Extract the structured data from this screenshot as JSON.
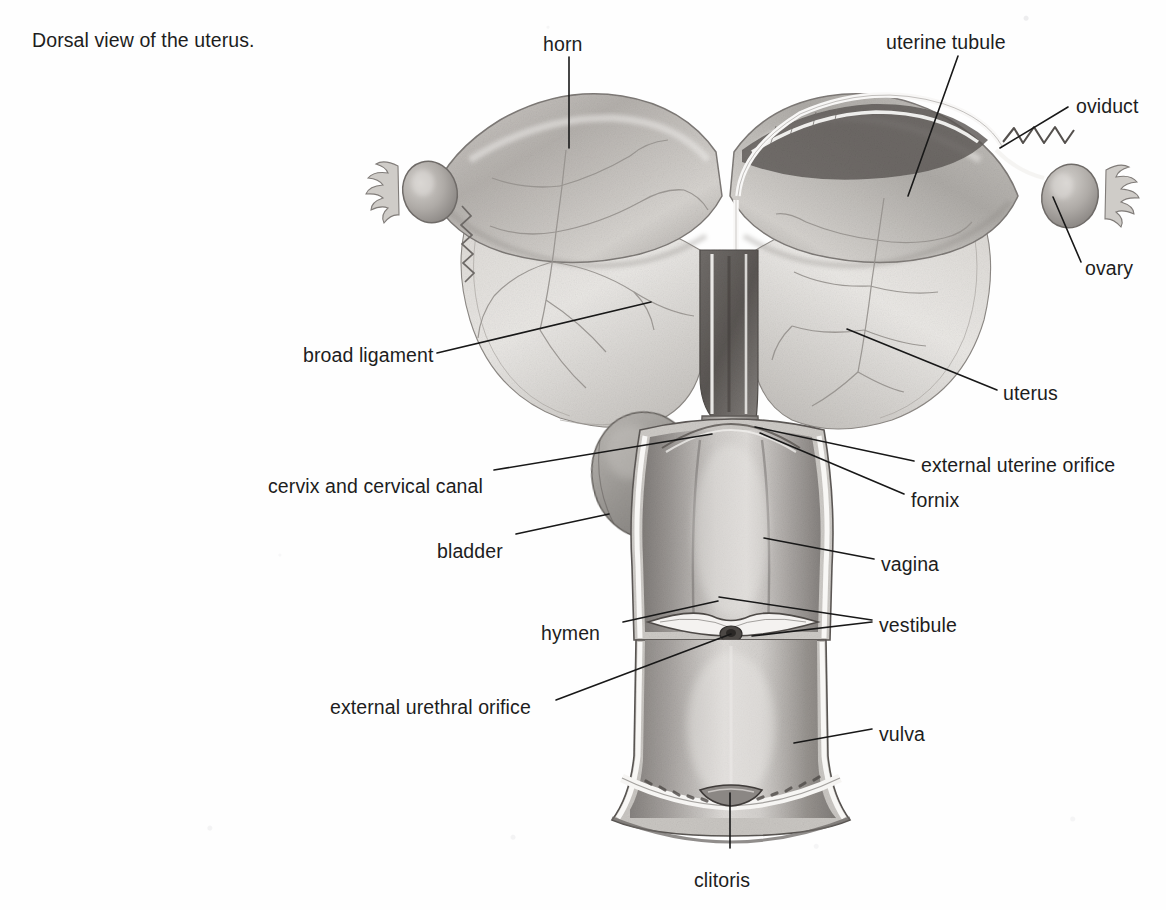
{
  "caption": "Dorsal view of the uterus.",
  "figure": {
    "title": "Dorsal view of the uterus",
    "style": "grayscale graphite illustration on white page"
  },
  "labels": [
    {
      "id": "horn",
      "text": "horn",
      "align": "left",
      "x": 543,
      "y": 33
    },
    {
      "id": "uterine-tubule",
      "text": "uterine tubule",
      "align": "left",
      "x": 886,
      "y": 31
    },
    {
      "id": "oviduct",
      "text": "oviduct",
      "align": "left",
      "x": 1076,
      "y": 95
    },
    {
      "id": "ovary",
      "text": "ovary",
      "align": "left",
      "x": 1085,
      "y": 257
    },
    {
      "id": "broad-ligament",
      "text": "broad ligament",
      "align": "left",
      "x": 303,
      "y": 344
    },
    {
      "id": "uterus",
      "text": "uterus",
      "align": "left",
      "x": 1003,
      "y": 382
    },
    {
      "id": "external-uterine-orifice",
      "text": "external uterine orifice",
      "align": "left",
      "x": 921,
      "y": 454
    },
    {
      "id": "cervix-and-cervical-canal",
      "text": "cervix and cervical canal",
      "align": "left",
      "x": 268,
      "y": 475
    },
    {
      "id": "fornix",
      "text": "fornix",
      "align": "left",
      "x": 911,
      "y": 489
    },
    {
      "id": "bladder",
      "text": "bladder",
      "align": "left",
      "x": 437,
      "y": 540
    },
    {
      "id": "vagina",
      "text": "vagina",
      "align": "left",
      "x": 881,
      "y": 553
    },
    {
      "id": "hymen",
      "text": "hymen",
      "align": "left",
      "x": 541,
      "y": 622
    },
    {
      "id": "vestibule",
      "text": "vestibule",
      "align": "left",
      "x": 879,
      "y": 614
    },
    {
      "id": "external-urethral-orifice",
      "text": "external urethral orifice",
      "align": "left",
      "x": 330,
      "y": 696
    },
    {
      "id": "vulva",
      "text": "vulva",
      "align": "left",
      "x": 879,
      "y": 723
    },
    {
      "id": "clitoris",
      "text": "clitoris",
      "align": "left",
      "x": 694,
      "y": 869
    }
  ],
  "leader_lines": [
    {
      "for": "horn",
      "points": "569,57 569,148"
    },
    {
      "for": "uterine-tubule",
      "points": "958,56 908,196"
    },
    {
      "for": "oviduct",
      "points": "1068,107 1000,148"
    },
    {
      "for": "ovary",
      "points": "1081,262 1053,197"
    },
    {
      "for": "broad-ligament",
      "points": "437,353 651,302"
    },
    {
      "for": "uterus",
      "points": "997,390 847,329"
    },
    {
      "for": "external-uterine-orifice",
      "points": "914,461 755,427"
    },
    {
      "for": "cervix-and-cervical-canal",
      "points": "494,470 712,434"
    },
    {
      "for": "fornix",
      "points": "904,494 760,433"
    },
    {
      "for": "bladder",
      "points": "516,534 609,514"
    },
    {
      "for": "vagina",
      "points": "874,559 764,538"
    },
    {
      "for": "hymen",
      "points": "623,622 718,601"
    },
    {
      "for": "vestibule-upper",
      "points": "872,620 719,597"
    },
    {
      "for": "vestibule-lower",
      "points": "872,622 752,636"
    },
    {
      "for": "external-urethral-orifice",
      "points": "556,700 731,634"
    },
    {
      "for": "vulva",
      "points": "872,729 794,743"
    },
    {
      "for": "clitoris",
      "points": "730,848 730,793"
    }
  ],
  "colors": {
    "page_background": "#fefefe",
    "text": "#1d1d1d",
    "leader_line": "#181818",
    "tissue_light": "#e3e1de",
    "tissue_mid": "#b9b6b2",
    "tissue_dark": "#8d8a86",
    "tissue_shadow": "#6b6764",
    "lumen_dark": "#55514e",
    "highlight": "#f7f6f4"
  }
}
